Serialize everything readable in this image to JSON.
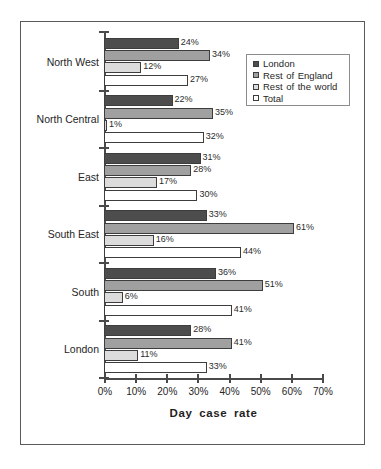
{
  "chart_data": {
    "type": "bar",
    "orientation": "horizontal",
    "title": "",
    "xlabel": "Day case rate",
    "ylabel": "",
    "xlim": [
      0,
      70
    ],
    "xticks": [
      "0%",
      "10%",
      "20%",
      "30%",
      "40%",
      "50%",
      "60%",
      "70%"
    ],
    "xtick_values": [
      0,
      10,
      20,
      30,
      40,
      50,
      60,
      70
    ],
    "grid": false,
    "legend_position": "top-right",
    "categories": [
      "North West",
      "North Central",
      "East",
      "South East",
      "South",
      "London"
    ],
    "series": [
      {
        "name": "London",
        "color": "#4d4d4d",
        "values": [
          24,
          22,
          31,
          33,
          36,
          28
        ],
        "labels": [
          "24%",
          "22%",
          "31%",
          "33%",
          "36%",
          "28%"
        ]
      },
      {
        "name": "Rest of England",
        "color": "#a0a0a0",
        "values": [
          34,
          35,
          28,
          61,
          51,
          41
        ],
        "labels": [
          "34%",
          "35%",
          "28%",
          "61%",
          "51%",
          "41%"
        ]
      },
      {
        "name": "Rest of the world",
        "color": "#dcdcdc",
        "values": [
          12,
          1,
          17,
          16,
          6,
          11
        ],
        "labels": [
          "12%",
          "1%",
          "17%",
          "16%",
          "6%",
          "11%"
        ]
      },
      {
        "name": "Total",
        "color": "#ffffff",
        "values": [
          27,
          32,
          30,
          44,
          41,
          33
        ],
        "labels": [
          "27%",
          "32%",
          "30%",
          "44%",
          "41%",
          "33%"
        ]
      }
    ]
  },
  "legend": {
    "items": [
      {
        "label": "London",
        "swatch": "s0"
      },
      {
        "label": "Rest of England",
        "swatch": "s1"
      },
      {
        "label": "Rest of the world",
        "swatch": "s2"
      },
      {
        "label": "Total",
        "swatch": "s3"
      }
    ]
  }
}
